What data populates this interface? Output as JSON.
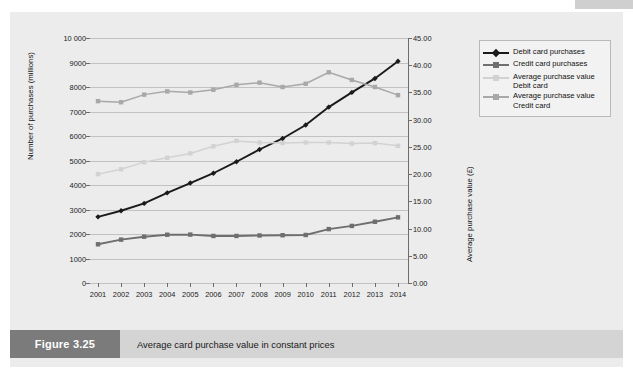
{
  "figure": {
    "tag": "Figure 3.25",
    "caption": "Average card purchase value in constant prices"
  },
  "colors": {
    "panel_bg": "#ececec",
    "caption_bar": "#d4d4d4",
    "caption_tag": "#7b7b7b",
    "grid": "#c2c2c2",
    "axis": "#6c6c6c",
    "debit_purchases": "#1a1a1a",
    "credit_purchases": "#6e6e6e",
    "avg_debit": "#d2d2d2",
    "avg_credit": "#a8a8a8"
  },
  "legend": {
    "position": "top-right",
    "entries": [
      {
        "label": "Debit card purchases",
        "color": "#1a1a1a",
        "marker": "diamond"
      },
      {
        "label": "Credit card purchases",
        "color": "#6e6e6e",
        "marker": "square"
      },
      {
        "label": "Average purchase value Debit card",
        "color": "#d2d2d2",
        "marker": "square"
      },
      {
        "label": "Average purchase value Credit card",
        "color": "#a8a8a8",
        "marker": "square"
      }
    ]
  },
  "chart_data": {
    "type": "line",
    "title": "Average card purchase value in constant prices",
    "xlabel": "",
    "ylabel": "Number of purchases (millions)",
    "y2label": "Average purchase value (£)",
    "grid": true,
    "categories": [
      "2001",
      "2002",
      "2003",
      "2004",
      "2005",
      "2006",
      "2007",
      "2008",
      "2009",
      "2010",
      "2011",
      "2012",
      "2013",
      "2014"
    ],
    "ylim": [
      0,
      10000
    ],
    "y2lim": [
      0,
      45
    ],
    "yticks": [
      "0",
      "1000",
      "2000",
      "3000",
      "4000",
      "5000",
      "6000",
      "7000",
      "8000",
      "9000",
      "10 000"
    ],
    "ytick_values": [
      0,
      1000,
      2000,
      3000,
      4000,
      5000,
      6000,
      7000,
      8000,
      9000,
      10000
    ],
    "y2ticks": [
      "0.00",
      "5.00",
      "10.00",
      "15.00",
      "20.00",
      "25.00",
      "30.00",
      "35.00",
      "40.00",
      "45.00"
    ],
    "y2tick_values": [
      0,
      5,
      10,
      15,
      20,
      25,
      30,
      35,
      40,
      45
    ],
    "series": [
      {
        "name": "Debit card purchases",
        "axis": "left",
        "color": "#1a1a1a",
        "marker": "diamond",
        "values": [
          2700,
          2950,
          3250,
          3680,
          4080,
          4480,
          4950,
          5450,
          5900,
          6450,
          7180,
          7780,
          8350,
          9050
        ]
      },
      {
        "name": "Credit card purchases",
        "axis": "left",
        "color": "#6e6e6e",
        "marker": "square",
        "values": [
          1580,
          1770,
          1890,
          1970,
          1975,
          1920,
          1920,
          1940,
          1950,
          1960,
          2200,
          2330,
          2500,
          2680
        ]
      },
      {
        "name": "Average purchase value Debit card",
        "axis": "right",
        "color": "#d2d2d2",
        "marker": "square",
        "values": [
          20.0,
          20.9,
          22.2,
          23.0,
          23.8,
          25.1,
          26.1,
          25.8,
          25.7,
          25.8,
          25.8,
          25.6,
          25.7,
          25.2
        ]
      },
      {
        "name": "Average purchase value Credit card",
        "axis": "right",
        "color": "#a8a8a8",
        "marker": "square",
        "values": [
          33.4,
          33.2,
          34.6,
          35.2,
          35.0,
          35.5,
          36.4,
          36.8,
          36.0,
          36.6,
          38.7,
          37.3,
          36.0,
          34.5
        ]
      }
    ]
  }
}
